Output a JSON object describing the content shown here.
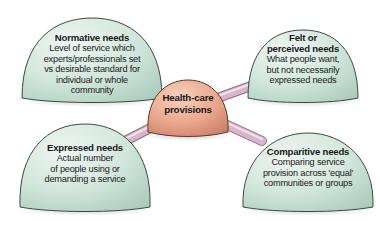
{
  "diagram": {
    "center": {
      "title": "Health-care provisions",
      "title_lines": [
        "Health-care",
        "provisions"
      ],
      "color": "#e9a48a"
    },
    "nodes": [
      {
        "id": "normative",
        "position": "top-left",
        "title": "Normative needs",
        "description_lines": [
          "Level of service which",
          "experts/professionals set",
          "vs desirable standard for",
          "individual or whole",
          "community"
        ],
        "color": "#cde3d9"
      },
      {
        "id": "felt",
        "position": "top-right",
        "title_lines": [
          "Felt or",
          "perceived needs"
        ],
        "description_lines": [
          "What people want,",
          "but not necessarily",
          "expressed needs"
        ],
        "color": "#cde3d9"
      },
      {
        "id": "expressed",
        "position": "bottom-left",
        "title": "Expressed needs",
        "description_lines": [
          "Actual number",
          "of people using or",
          "demanding a service"
        ],
        "color": "#cde3d9"
      },
      {
        "id": "comparative",
        "position": "bottom-right",
        "title": "Comparitive needs",
        "description_lines": [
          "Comparing service",
          "provision across 'equal'",
          "communities or groups"
        ],
        "color": "#cde3d9"
      }
    ],
    "connector_color": "#d7b6cc"
  }
}
